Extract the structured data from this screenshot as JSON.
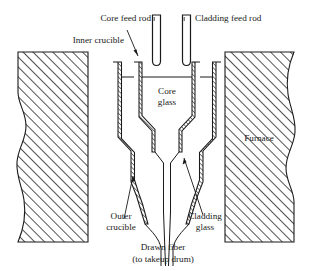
{
  "figure": {
    "type": "cross-section schematic",
    "background_color": "#ffffff",
    "line_color": "#1a1a1a"
  },
  "labels": {
    "core_feed_rod": "Core feed rod",
    "cladding_feed_rod": "Cladding feed rod",
    "inner_crucible": "Inner crucible",
    "outer_crucible_line1": "Outer",
    "outer_crucible_line2": "crucible",
    "core_glass_line1": "Core",
    "core_glass_line2": "glass",
    "cladding_glass_line1": "Cladding",
    "cladding_glass_line2": "glass",
    "furnace": "Furnace",
    "drawn_fiber_line1": "Drawn fiber",
    "drawn_fiber_line2": "(to takeup drum)"
  },
  "components": {
    "furnace_blocks": [
      {
        "name": "furnace-block-left",
        "hatch": "diagonal",
        "break_edge": "right"
      },
      {
        "name": "furnace-block-right",
        "hatch": "diagonal",
        "break_edge": "right"
      }
    ],
    "feed_rods": [
      {
        "name": "core-feed-rod",
        "shape": "rounded-rod"
      },
      {
        "name": "cladding-feed-rod",
        "shape": "rounded-rod"
      }
    ],
    "crucibles": [
      {
        "name": "inner-crucible",
        "wall": "hatched"
      },
      {
        "name": "outer-crucible",
        "wall": "hatched"
      }
    ],
    "melt_levels": [
      "core-glass-level",
      "cladding-glass-level"
    ],
    "fiber": {
      "name": "drawn-fiber",
      "direction": "downward"
    }
  }
}
